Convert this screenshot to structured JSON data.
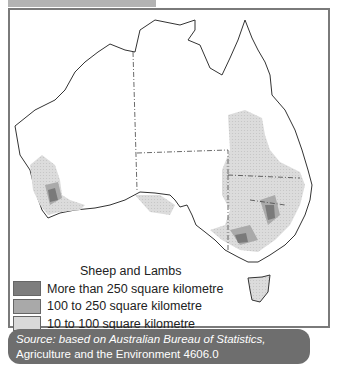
{
  "header": {
    "tab_label": ""
  },
  "map": {
    "title": "Sheep and Lambs",
    "region": "Australia",
    "legend": [
      {
        "label": "More than 250 square kilometre",
        "color": "#7d7d7d"
      },
      {
        "label": "100 to 250 square kilometre",
        "color": "#a9a9a9"
      },
      {
        "label": "10 to 100 square kilometre",
        "color": "#d9d9d9"
      },
      {
        "label": "Less than 10 square kilometre",
        "color": "#ffffff"
      }
    ]
  },
  "source": {
    "prefix": "Source: based on Australian Bureau of Statistics,",
    "title": "Agriculture and the Environment 4606.0"
  }
}
